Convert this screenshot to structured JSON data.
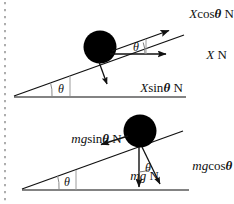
{
  "figure": {
    "background_color": "#ffffff",
    "ink_color": "#111111",
    "ball_color": "#000000",
    "width": 234,
    "height": 204
  },
  "margin": {
    "name": "scanned-page-perforation-margin",
    "dash_color": "#9a9a9a",
    "x": 5
  },
  "diagrams": [
    {
      "id": "upper",
      "name": "applied-force-resolution",
      "incline_angle_label": "θ",
      "ball": {
        "cx": 100,
        "cy": 47,
        "r": 16
      },
      "vectors": [
        {
          "name": "x-cos-theta-n-vector",
          "label_parts": {
            "sym": "X",
            "func": "cos",
            "theta": "θ",
            "unit": "N"
          },
          "label_text": "XcosθN",
          "direction": "up-the-incline"
        },
        {
          "name": "xn-vector",
          "label_parts": {
            "sym": "X",
            "func": "",
            "theta": "",
            "unit": "N"
          },
          "label_text": "XN",
          "direction": "horizontal-right"
        },
        {
          "name": "x-sin-theta-n-vector",
          "label_parts": {
            "sym": "X",
            "func": "sin",
            "theta": "θ",
            "unit": "N"
          },
          "label_text": "XsinθN",
          "direction": "down-perpendicular"
        }
      ],
      "angles": [
        {
          "name": "ball-angle-theta",
          "label": "θ"
        },
        {
          "name": "base-angle-theta",
          "label": "θ"
        }
      ]
    },
    {
      "id": "lower",
      "name": "weight-force-resolution",
      "incline_angle_label": "θ",
      "ball": {
        "cx": 140,
        "cy": 131,
        "r": 16
      },
      "vectors": [
        {
          "name": "mg-sin-theta-n-vector",
          "label_parts": {
            "sym": "mg",
            "func": "sin",
            "theta": "θ",
            "unit": "N"
          },
          "label_text": "mgsinθN",
          "direction": "down-the-incline"
        },
        {
          "name": "mgn-vector",
          "label_parts": {
            "sym": "mg",
            "func": "",
            "theta": "",
            "unit": "N"
          },
          "label_text": "mgN",
          "direction": "vertical-down"
        },
        {
          "name": "mg-cos-theta-n-vector",
          "label_parts": {
            "sym": "mg",
            "func": "cos",
            "theta": "θ",
            "unit": "N"
          },
          "label_text": "mgcosθN",
          "direction": "down-perpendicular"
        }
      ],
      "angles": [
        {
          "name": "ball-angle-theta",
          "label": "θ"
        },
        {
          "name": "base-angle-theta",
          "label": "θ"
        }
      ]
    }
  ]
}
